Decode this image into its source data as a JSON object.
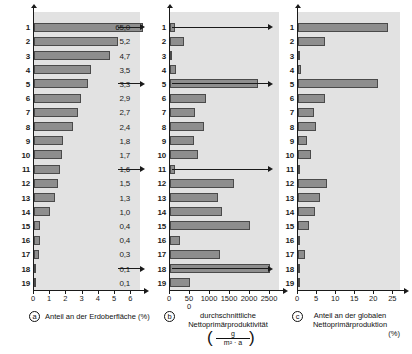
{
  "figure": {
    "title": "",
    "row_labels": [
      "1",
      "2",
      "3",
      "4",
      "5",
      "6",
      "7",
      "8",
      "9",
      "10",
      "11",
      "12",
      "13",
      "14",
      "15",
      "16",
      "17",
      "18",
      "19"
    ],
    "link_rows": [
      "1",
      "5",
      "11",
      "18"
    ],
    "colors": {
      "bar_fill": "#8e8e8e",
      "bar_stroke": "#4a4a4a",
      "plot_background": "#e2e2e2",
      "page_background": "#ffffff",
      "text": "#1a1a1a"
    }
  },
  "chart_data": [
    {
      "type": "bar",
      "panel": "a",
      "orientation": "horizontal",
      "title": "",
      "xlabel": "Anteil an der Erdoberfläche (%)",
      "ylabel": "",
      "xlim": [
        0,
        6.6
      ],
      "xticks": [
        0,
        1,
        2,
        3,
        4,
        5,
        6
      ],
      "xticklabels": [
        "0",
        "1",
        "2",
        "3",
        "4",
        "5",
        "6"
      ],
      "grid": false,
      "categories": [
        "1",
        "2",
        "3",
        "4",
        "5",
        "6",
        "7",
        "8",
        "9",
        "10",
        "11",
        "12",
        "13",
        "14",
        "15",
        "16",
        "17",
        "18",
        "19"
      ],
      "values": [
        65.0,
        5.2,
        4.7,
        3.5,
        3.3,
        2.9,
        2.7,
        2.4,
        1.8,
        1.7,
        1.6,
        1.5,
        1.3,
        1.0,
        0.4,
        0.4,
        0.3,
        0.1,
        0.1
      ],
      "data_labels": [
        "65,0",
        "5,2",
        "4,7",
        "3,5",
        "3,3",
        "2,9",
        "2,7",
        "2,4",
        "1,8",
        "1,7",
        "1,6",
        "1,5",
        "1,3",
        "1,0",
        "0,4",
        "0,4",
        "0,3",
        "0,1",
        "0,1"
      ],
      "note": "Bar 1 (65,0) exceeds the axis range and is drawn full-width"
    },
    {
      "type": "bar",
      "panel": "b",
      "orientation": "horizontal",
      "title": "",
      "xlabel": "durchschnittliche Nettoprimärproduktivität",
      "xlabel_unit_numerator": "g",
      "xlabel_unit_denominator": "m² · a",
      "ylabel": "",
      "xlim": [
        0,
        2750
      ],
      "xticks": [
        0,
        500,
        1000,
        1500,
        2000,
        2500
      ],
      "xticklabels": [
        "0",
        "500",
        "1000",
        "1500",
        "2000",
        "2500"
      ],
      "grid": false,
      "categories": [
        "1",
        "2",
        "3",
        "4",
        "5",
        "6",
        "7",
        "8",
        "9",
        "10",
        "11",
        "12",
        "13",
        "14",
        "15",
        "16",
        "17",
        "18",
        "19"
      ],
      "values": [
        125,
        360,
        35,
        155,
        2200,
        900,
        630,
        860,
        600,
        700,
        125,
        1600,
        1200,
        1300,
        2000,
        250,
        1250,
        2500,
        500
      ]
    },
    {
      "type": "bar",
      "panel": "c",
      "orientation": "horizontal",
      "title": "",
      "xlabel": "Anteil an der globalen Nettoprimärproduktion",
      "xlabel_unit": "(%)",
      "ylabel": "",
      "xlim": [
        0,
        27
      ],
      "xticks": [
        0,
        5,
        10,
        15,
        20,
        25
      ],
      "xticklabels": [
        "0",
        "5",
        "10",
        "15",
        "20",
        "25"
      ],
      "grid": false,
      "categories": [
        "1",
        "2",
        "3",
        "4",
        "5",
        "6",
        "7",
        "8",
        "9",
        "10",
        "11",
        "12",
        "13",
        "14",
        "15",
        "16",
        "17",
        "18",
        "19"
      ],
      "values": [
        23.5,
        7.2,
        0.3,
        0.7,
        21.0,
        7.0,
        4.2,
        4.6,
        2.4,
        3.3,
        0.4,
        7.6,
        5.8,
        4.5,
        2.9,
        0.4,
        1.8,
        0.6,
        0.2
      ]
    }
  ],
  "panels": {
    "a": {
      "letter": "a",
      "xlabel": "Anteil an der Erdoberfläche (%)",
      "ticks": [
        "0",
        "1",
        "2",
        "3",
        "4",
        "5",
        "6"
      ]
    },
    "b": {
      "letter": "b",
      "xlabel_line1": "durchschnittliche",
      "xlabel_line2": "Nettoprimärproduktivität",
      "unit_numerator": "g",
      "unit_denominator": "m² · a",
      "ticks": [
        "0",
        "500",
        "1000",
        "1500",
        "2000",
        "2500"
      ]
    },
    "c": {
      "letter": "c",
      "xlabel_line1": "Anteil an der globalen",
      "xlabel_line2": "Nettoprimärproduktion",
      "xlabel_line3": "(%)",
      "ticks": [
        "0",
        "5",
        "10",
        "15",
        "20",
        "25"
      ]
    }
  }
}
